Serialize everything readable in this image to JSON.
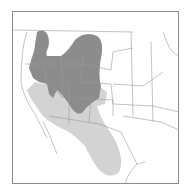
{
  "map": {
    "type": "range-map",
    "region": "Western United States and northern Mexico",
    "colors": {
      "background": "#ffffff",
      "frame": "#8a8a8a",
      "borders": "#9a9a9a",
      "range_primary": "#8c8c8c",
      "range_secondary": "#d3d3d3"
    },
    "legend": []
  }
}
